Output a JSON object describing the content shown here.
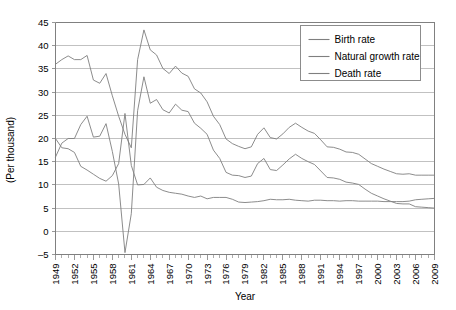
{
  "chart_data": {
    "type": "line",
    "title": "",
    "xlabel": "Year",
    "ylabel": "(Per thousand)",
    "xlim": [
      1949,
      2009
    ],
    "ylim": [
      -5,
      45
    ],
    "yticks": [
      -5,
      0,
      5,
      10,
      15,
      20,
      25,
      30,
      35,
      40,
      45
    ],
    "xticks": [
      1949,
      1952,
      1955,
      1958,
      1961,
      1964,
      1967,
      1970,
      1973,
      1976,
      1979,
      1982,
      1985,
      1988,
      1991,
      1994,
      1997,
      2000,
      2003,
      2006,
      2009
    ],
    "xtick_rotation": 90,
    "grid": "horizontal",
    "legend_position": "top-right",
    "line_color": "#7f7f7f",
    "x": [
      1949,
      1950,
      1951,
      1952,
      1953,
      1954,
      1955,
      1956,
      1957,
      1958,
      1959,
      1960,
      1961,
      1962,
      1963,
      1964,
      1965,
      1966,
      1967,
      1968,
      1969,
      1970,
      1971,
      1972,
      1973,
      1974,
      1975,
      1976,
      1977,
      1978,
      1979,
      1980,
      1981,
      1982,
      1983,
      1984,
      1985,
      1986,
      1987,
      1988,
      1989,
      1990,
      1991,
      1992,
      1993,
      1994,
      1995,
      1996,
      1997,
      1998,
      1999,
      2000,
      2001,
      2002,
      2003,
      2004,
      2005,
      2006,
      2007,
      2008,
      2009
    ],
    "series": [
      {
        "name": "Birth rate",
        "values": [
          36.0,
          37.0,
          37.8,
          37.0,
          37.0,
          37.9,
          32.6,
          31.9,
          34.0,
          29.2,
          24.8,
          20.9,
          18.0,
          37.0,
          43.4,
          39.1,
          38.0,
          35.1,
          34.0,
          35.6,
          34.1,
          33.4,
          30.7,
          29.8,
          27.9,
          24.8,
          23.0,
          19.9,
          18.9,
          18.3,
          17.8,
          18.2,
          20.9,
          22.3,
          20.2,
          19.9,
          21.0,
          22.4,
          23.3,
          22.4,
          21.6,
          21.1,
          19.7,
          18.2,
          18.1,
          17.7,
          17.1,
          17.0,
          16.6,
          15.6,
          14.6,
          14.0,
          13.4,
          12.9,
          12.4,
          12.3,
          12.4,
          12.1,
          12.1,
          12.1,
          12.1
        ]
      },
      {
        "name": "Natural growth rate",
        "values": [
          16.0,
          19.0,
          20.0,
          20.0,
          23.0,
          24.8,
          20.3,
          20.5,
          23.2,
          17.2,
          10.2,
          -4.6,
          3.8,
          26.0,
          33.3,
          27.6,
          28.4,
          26.2,
          25.5,
          27.4,
          26.1,
          25.8,
          23.3,
          22.2,
          20.9,
          17.5,
          15.7,
          12.7,
          12.1,
          12.0,
          11.6,
          11.9,
          14.6,
          15.7,
          13.3,
          13.1,
          14.3,
          15.6,
          16.6,
          15.7,
          15.0,
          14.4,
          13.0,
          11.6,
          11.5,
          11.2,
          10.6,
          10.4,
          10.1,
          9.1,
          8.2,
          7.6,
          7.0,
          6.5,
          6.0,
          5.9,
          5.9,
          5.3,
          5.2,
          5.1,
          5.0
        ]
      },
      {
        "name": "Death rate",
        "values": [
          20.0,
          18.0,
          17.8,
          17.0,
          14.0,
          13.2,
          12.3,
          11.4,
          10.8,
          12.0,
          14.6,
          25.4,
          14.2,
          10.0,
          10.1,
          11.5,
          9.5,
          8.8,
          8.4,
          8.2,
          8.0,
          7.6,
          7.3,
          7.6,
          7.0,
          7.3,
          7.3,
          7.3,
          6.9,
          6.3,
          6.2,
          6.3,
          6.4,
          6.6,
          6.9,
          6.8,
          6.8,
          6.9,
          6.7,
          6.6,
          6.5,
          6.7,
          6.7,
          6.6,
          6.6,
          6.5,
          6.6,
          6.6,
          6.5,
          6.5,
          6.5,
          6.5,
          6.4,
          6.4,
          6.4,
          6.4,
          6.5,
          6.8,
          6.9,
          7.0,
          7.1
        ]
      }
    ],
    "legend": [
      "Birth rate",
      "Natural growth rate",
      "Death rate"
    ]
  }
}
